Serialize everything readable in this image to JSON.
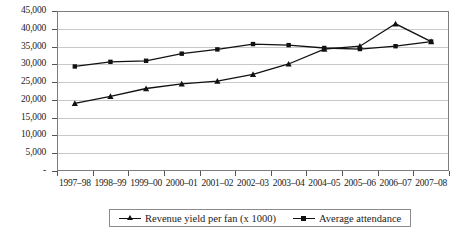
{
  "chart_data": {
    "type": "line",
    "title": "",
    "xlabel": "",
    "ylabel": "",
    "grid": true,
    "legend_position": "bottom",
    "ylim": [
      0,
      45000
    ],
    "ytick_labels": [
      "45,000",
      "40,000",
      "35,000",
      "30,000",
      "25,000",
      "20,000",
      "15,000",
      "10,000",
      "5,000",
      "-"
    ],
    "ytick_values": [
      45000,
      40000,
      35000,
      30000,
      25000,
      20000,
      15000,
      10000,
      5000,
      0
    ],
    "categories": [
      "1997–98",
      "1998–99",
      "1999–00",
      "2000–01",
      "2001–02",
      "2002–03",
      "2003–04",
      "2004–05",
      "2005–06",
      "2006–07",
      "2007–08"
    ],
    "series": [
      {
        "name": "Revenue yield per fan (x 1000)",
        "marker": "triangle",
        "color": "#111111",
        "values": [
          19000,
          21000,
          23200,
          24500,
          25300,
          27200,
          30100,
          34300,
          35100,
          41400,
          36400
        ]
      },
      {
        "name": "Average attendance",
        "marker": "square",
        "color": "#111111",
        "values": [
          29400,
          30700,
          31000,
          33000,
          34200,
          35700,
          35400,
          34600,
          34300,
          35100,
          36400
        ]
      }
    ]
  },
  "legend": {
    "items": [
      {
        "label": "Revenue yield per fan (x 1000)",
        "marker": "triangle-marker"
      },
      {
        "label": "Average attendance",
        "marker": "square-marker"
      }
    ]
  }
}
